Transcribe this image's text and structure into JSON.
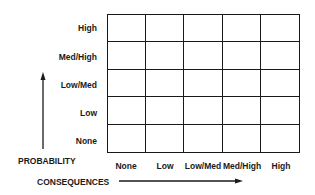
{
  "diagram": {
    "type": "risk-matrix",
    "rows": 5,
    "columns": 5,
    "y_axis": {
      "title": "PROBABILITY",
      "labels_top_to_bottom": [
        "High",
        "Med/High",
        "Low/Med",
        "Low",
        "None"
      ]
    },
    "x_axis": {
      "title": "CONSEQUENCES",
      "labels_left_to_right": [
        "None",
        "Low",
        "Low/Med",
        "Med/High",
        "High"
      ]
    },
    "line_color": "#1a1a1a",
    "background": "#ffffff"
  }
}
